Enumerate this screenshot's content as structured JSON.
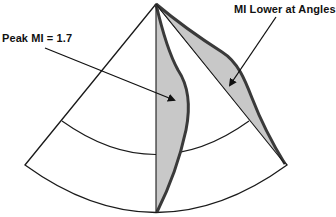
{
  "diagram": {
    "labels": {
      "peak": "Peak MI = 1.7",
      "lower": "MI Lower at Angles"
    },
    "colors": {
      "outline": "#1a1a1a",
      "fill": "#c8c8c8",
      "lobe_edge": "#3a3a3a",
      "background": "#ffffff"
    },
    "sector": {
      "apex": [
        156,
        4
      ],
      "left_end": [
        25,
        165
      ],
      "right_end": [
        287,
        165
      ],
      "bottom_mid": [
        156,
        216
      ]
    },
    "inner_arc": {
      "left": [
        62,
        121
      ],
      "mid": [
        156,
        157
      ],
      "right": [
        249,
        121
      ]
    },
    "arrows": [
      {
        "name": "peak-arrow",
        "from": [
          45,
          48
        ],
        "to": [
          174,
          100
        ]
      },
      {
        "name": "lower-arrow",
        "from": [
          276,
          17
        ],
        "to": [
          230,
          85
        ]
      }
    ]
  }
}
